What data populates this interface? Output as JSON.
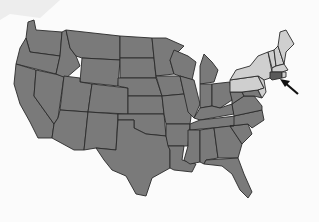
{
  "map": {
    "subject": "United States (contiguous 48 states)",
    "colors": {
      "background": "#fbfbfb",
      "default_state": "#7a7a7a",
      "highlighted_region": "#cfcfcf",
      "target_state": "#5a5a5a",
      "border": "#2a2a2a",
      "arrow": "#111111"
    },
    "highlighted_region": {
      "name": "Northeast",
      "states": [
        "Maine",
        "New Hampshire",
        "Vermont",
        "Massachusetts",
        "New York",
        "Pennsylvania",
        "New Jersey"
      ]
    },
    "target": {
      "state": "Connecticut",
      "indicator": "arrow-pointing-up-left"
    },
    "labels": []
  }
}
